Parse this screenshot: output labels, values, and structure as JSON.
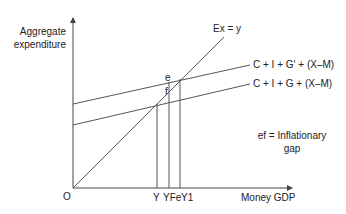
{
  "diagram": {
    "type": "keynesian-cross",
    "colors": {
      "line": "#555555",
      "text": "#222222",
      "background": "#ffffff"
    },
    "axes": {
      "y_label_line1": "Aggregate",
      "y_label_line2": "expenditure",
      "x_label": "Money GDP",
      "origin_label": "O"
    },
    "lines": {
      "forty_five": "Ex = y",
      "upper_ae": "C + I + G' + (X–M)",
      "lower_ae": "C + I + G + (X–M)"
    },
    "points": {
      "e": "e",
      "f": "f"
    },
    "x_ticks": {
      "y": "Y",
      "yfe": "YFe",
      "y1": "Y1",
      "combined": "Y YFeY1"
    },
    "annotation": {
      "line1": "ef = Inflationary",
      "line2": "gap"
    }
  }
}
